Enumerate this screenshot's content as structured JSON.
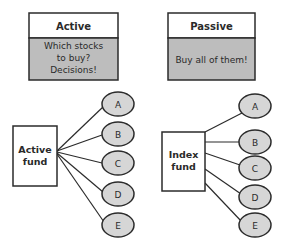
{
  "panels": [
    {
      "id": "active",
      "header": "Active",
      "body_lines": [
        "Which stocks",
        "to buy?",
        "Decisions!"
      ],
      "fund_label_lines": [
        "Active",
        "fund"
      ],
      "stocks": [
        "A",
        "B",
        "C",
        "D",
        "E"
      ]
    },
    {
      "id": "passive",
      "header": "Passive",
      "body_lines": [
        "Buy all of them!"
      ],
      "fund_label_lines": [
        "Index",
        "fund"
      ],
      "stocks": [
        "A",
        "B",
        "C",
        "D",
        "E"
      ]
    }
  ],
  "colors": {
    "stroke": "#2b2b2b",
    "header_fill": "#ffffff",
    "body_fill": "#bdbdbd",
    "ellipse_fill": "#d6d6d6",
    "fund_fill": "#ffffff",
    "text": "#2a2a2a"
  }
}
